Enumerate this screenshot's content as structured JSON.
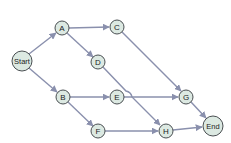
{
  "diagram": {
    "type": "directed-graph",
    "colors": {
      "node_fill": "#dce9e2",
      "node_stroke": "#4a4f52",
      "edge": "#8a90ad"
    },
    "nodes": {
      "start": {
        "label": "Start"
      },
      "a": {
        "label": "A"
      },
      "b": {
        "label": "B"
      },
      "c": {
        "label": "C"
      },
      "d": {
        "label": "D"
      },
      "e": {
        "label": "E"
      },
      "f": {
        "label": "F"
      },
      "g": {
        "label": "G"
      },
      "h": {
        "label": "H"
      },
      "end": {
        "label": "End"
      }
    },
    "edges": [
      {
        "from": "Start",
        "to": "A"
      },
      {
        "from": "Start",
        "to": "B"
      },
      {
        "from": "A",
        "to": "C"
      },
      {
        "from": "A",
        "to": "D"
      },
      {
        "from": "B",
        "to": "E"
      },
      {
        "from": "B",
        "to": "F"
      },
      {
        "from": "C",
        "to": "G"
      },
      {
        "from": "D",
        "to": "H"
      },
      {
        "from": "E",
        "to": "G"
      },
      {
        "from": "F",
        "to": "H"
      },
      {
        "from": "G",
        "to": "End"
      },
      {
        "from": "H",
        "to": "End"
      }
    ]
  }
}
